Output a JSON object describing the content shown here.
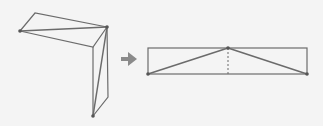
{
  "diagram": {
    "colors": {
      "background": "#f4f4f4",
      "line": "#6b6b6b",
      "dot": "#555555",
      "arrow": "#8a8a8a"
    },
    "folded_shape": {
      "points": {
        "left": [
          20,
          31
        ],
        "top_left": [
          35,
          13
        ],
        "corner": [
          107,
          27
        ],
        "inner": [
          93,
          47
        ],
        "bottom": [
          93,
          116
        ],
        "bottom_right": [
          108,
          97
        ]
      }
    },
    "arrow": {
      "from": [
        121,
        59
      ],
      "to": [
        137,
        59
      ],
      "icon": "right-arrow-icon"
    },
    "flat_shape": {
      "rect": {
        "x": 148,
        "y": 48,
        "width": 159,
        "height": 26
      },
      "apex": [
        228,
        48
      ],
      "base_left": [
        148,
        74
      ],
      "base_right": [
        307,
        74
      ],
      "dashed_height": true
    }
  }
}
